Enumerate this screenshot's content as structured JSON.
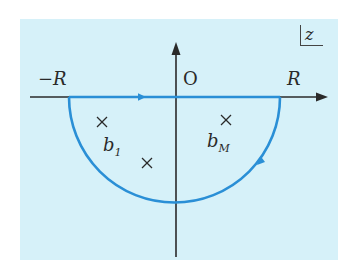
{
  "diagram": {
    "plane_label": "z",
    "origin_label": "O",
    "left_endpoint_label": "−R",
    "right_endpoint_label": "R",
    "poles": [
      {
        "name": "b",
        "subscript": "1"
      },
      {
        "name": "b",
        "subscript": "M"
      }
    ],
    "pole_marker": "×",
    "contour": {
      "type": "semicircle-lower-half-plane",
      "direction": "clockwise",
      "color": "#2a8fd6"
    },
    "axis_color": "#2a2a2a",
    "background_color": "#d6f1f9"
  }
}
